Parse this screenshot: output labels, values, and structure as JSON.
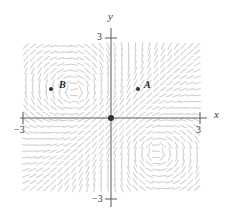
{
  "figure": {
    "background_color": "#ffffff",
    "axis_color": "#5a5a5a",
    "field_color": "#d2d2d2",
    "point_color": "#303030"
  },
  "axes": {
    "x_label": "x",
    "y_label": "y",
    "x_min_tick": "−3",
    "x_max_tick": "3",
    "y_min_tick": "−3",
    "y_max_tick": "3",
    "x_range": [
      -3,
      3
    ],
    "y_range": [
      -3,
      3
    ],
    "origin_marker": "filled-dot"
  },
  "points": [
    {
      "id": "A",
      "label": "A",
      "x": 1.0,
      "y": 0.95
    },
    {
      "id": "B",
      "label": "B",
      "x": -1.2,
      "y": 0.95
    }
  ],
  "chart_data": {
    "type": "scatter",
    "xlabel": "x",
    "ylabel": "y",
    "xlim": [
      -3,
      3
    ],
    "ylim": [
      -3,
      3
    ],
    "xticks": [
      -3,
      3
    ],
    "yticks": [
      -3,
      3
    ],
    "xticklabels": [
      "−3",
      "3"
    ],
    "yticklabels": [
      "−3",
      "3"
    ],
    "grid": false,
    "legend": "none",
    "annotations": [
      "A",
      "B"
    ],
    "series": [
      {
        "name": "labeled points",
        "x": [
          1.0,
          -1.2
        ],
        "y": [
          0.95,
          0.95
        ],
        "labels": [
          "A",
          "B"
        ]
      },
      {
        "name": "equilibrium",
        "x": [
          0
        ],
        "y": [
          0
        ],
        "labels": [
          ""
        ]
      }
    ],
    "direction_field": {
      "description": "slope field of short dashes covering the square domain; counterclockwise vortex centered near (-1.2, 0.95) and a vortex near (1.4, -1.2)",
      "domain_x": [
        -2.9,
        2.9
      ],
      "domain_y": [
        -2.6,
        2.7
      ],
      "grid_nx": 26,
      "grid_ny": 24,
      "vortices": [
        {
          "cx": -1.2,
          "cy": 0.95,
          "strength": 1.0
        },
        {
          "cx": 1.45,
          "cy": -1.2,
          "strength": -1.0
        }
      ]
    }
  }
}
